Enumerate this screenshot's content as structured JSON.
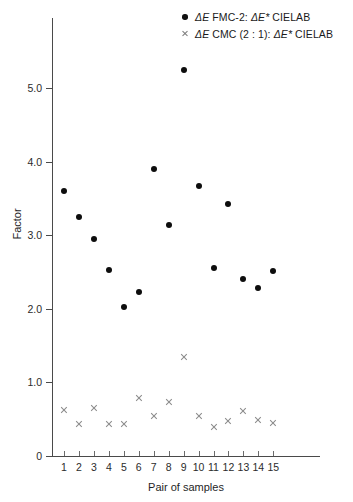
{
  "chart_data": {
    "type": "scatter",
    "title": "",
    "xlabel": "Pair of samples",
    "ylabel": "Factor",
    "xlim": [
      0.3,
      15.7
    ],
    "ylim": [
      0,
      5.6
    ],
    "grid": false,
    "legend_position": "top-right",
    "x": [
      1,
      2,
      3,
      4,
      5,
      6,
      7,
      8,
      9,
      10,
      11,
      12,
      13,
      14,
      15
    ],
    "categories": [
      "1",
      "2",
      "3",
      "4",
      "5",
      "6",
      "7",
      "8",
      "9",
      "10",
      "11",
      "12",
      "13",
      "14",
      "15"
    ],
    "ytick_labels": [
      "0",
      "1.0",
      "2.0",
      "3.0",
      "4.0",
      "5.0"
    ],
    "ytick_values": [
      0,
      1.0,
      2.0,
      3.0,
      4.0,
      5.0
    ],
    "series": [
      {
        "name": "ΔE FMC-2: ΔE* CIELAB",
        "marker": "filled-circle",
        "color": "#0d0d0d",
        "values": [
          3.6,
          3.25,
          2.95,
          2.53,
          2.02,
          2.23,
          3.9,
          3.14,
          5.25,
          3.67,
          2.56,
          3.43,
          2.4,
          2.28,
          2.52
        ]
      },
      {
        "name": "ΔE CMC (2 : 1): ΔE* CIELAB",
        "marker": "cross",
        "color": "#8a8a8a",
        "values": [
          0.63,
          0.44,
          0.65,
          0.44,
          0.43,
          0.79,
          0.55,
          0.74,
          1.35,
          0.55,
          0.4,
          0.48,
          0.61,
          0.49,
          0.45
        ]
      }
    ]
  },
  "legend": {
    "entries": [
      {
        "marker": "filled-circle",
        "delta_e": "ΔE",
        "label_mid": " FMC-2: ",
        "delta_e_star": "ΔE*",
        "label_end": " CIELAB"
      },
      {
        "marker": "cross",
        "delta_e": "ΔE",
        "label_mid": " CMC (2 : 1): ",
        "delta_e_star": "ΔE*",
        "label_end": " CIELAB"
      }
    ]
  }
}
